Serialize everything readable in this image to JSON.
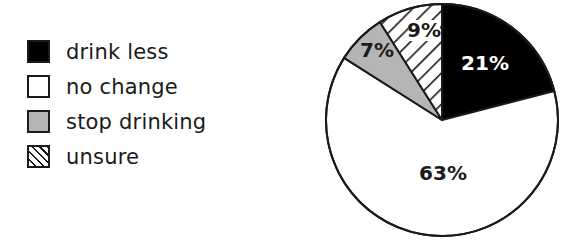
{
  "chart_data": {
    "type": "pie",
    "title": "",
    "categories": [
      "drink less",
      "no change",
      "stop drinking",
      "unsure"
    ],
    "values": [
      21,
      63,
      7,
      9
    ],
    "value_labels": [
      "21%",
      "63%",
      "7%",
      "9%"
    ],
    "unit": "%",
    "legend_position": "left",
    "start_angle_deg": 0,
    "direction": "clockwise-from-top for 'drink less' then 'no change', 'stop drinking', 'unsure'",
    "fills": {
      "drink less": "solid black",
      "no change": "white",
      "stop drinking": "light gray",
      "unsure": "diagonal hatch"
    }
  },
  "legend": {
    "items": [
      {
        "label": "drink less",
        "swatch": "solid-black"
      },
      {
        "label": "no change",
        "swatch": "solid-white"
      },
      {
        "label": "stop drinking",
        "swatch": "solid-gray"
      },
      {
        "label": "unsure",
        "swatch": "hatch"
      }
    ]
  },
  "colors": {
    "drink_less": "#000000",
    "no_change": "#ffffff",
    "stop_drinking": "#b5b5b5",
    "unsure_hatch": "#1a1a1a",
    "outline": "#1a1a1a",
    "label_on_dark": "#ffffff",
    "label_on_light": "#1a1a1a"
  }
}
